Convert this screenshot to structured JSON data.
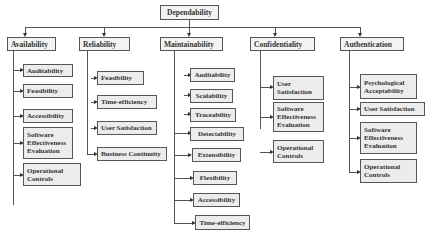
{
  "root": {
    "label": "Dependability"
  },
  "categories": [
    {
      "label": "Availability",
      "children": [
        "Auditability",
        "Feasibility",
        "Accessibility",
        "Software Effectiveness Evaluation",
        "Operational Controls"
      ]
    },
    {
      "label": "Reliability",
      "children": [
        "Feasibility",
        "Time-efficiency",
        "User Satisfaction",
        "Business Continuity"
      ]
    },
    {
      "label": "Maintainability",
      "children": [
        "Auditability",
        "Scalability",
        "Traceability",
        "Detectability",
        "Extensibility",
        "Flexibility",
        "Accessibility",
        "Time-efficiency"
      ]
    },
    {
      "label": "Confidentiality",
      "children": [
        "User Satisfaction",
        "Software Effectiveness Evaluation",
        "Operational Controls"
      ]
    },
    {
      "label": "Authentication",
      "children": [
        "Psychological Acceptability",
        "User Satisfaction",
        "Software Effectiveness Evaluation",
        "Operational Controls"
      ]
    }
  ],
  "colors": {
    "box_fill": "#ececec",
    "border": "#555555",
    "text": "#333333",
    "background": "#ffffff"
  }
}
